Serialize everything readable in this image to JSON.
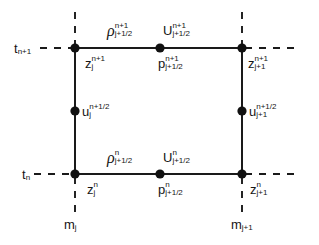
{
  "figure": {
    "type": "staggered-grid-stencil-diagram",
    "background_color": "#ffffff",
    "line_color": "#1a1a1a",
    "node_color": "#111111"
  },
  "axes": {
    "time_labels": [
      {
        "base": "t",
        "sub": "n+1",
        "sup": ""
      },
      {
        "base": "t",
        "sub": "n",
        "sup": ""
      }
    ],
    "mass_labels": [
      {
        "base": "m",
        "sub": "j",
        "sup": ""
      },
      {
        "base": "m",
        "sub": "j+1",
        "sup": ""
      }
    ]
  },
  "labels": {
    "rho_top": {
      "base": "ρ",
      "sup": "n+1",
      "sub": "j+1/2"
    },
    "U_top": {
      "base": "U",
      "sup": "n+1",
      "sub": "j+1/2"
    },
    "z_top_left": {
      "base": "z",
      "sup": "n+1",
      "sub": "j"
    },
    "p_top": {
      "base": "p",
      "sup": "n+1",
      "sub": "j+1/2"
    },
    "z_top_right": {
      "base": "z",
      "sup": "n+1",
      "sub": "j+1"
    },
    "u_left": {
      "base": "u",
      "sup": "n+1/2",
      "sub": "j"
    },
    "u_right": {
      "base": "u",
      "sup": "n+1/2",
      "sub": "j+1"
    },
    "rho_bot": {
      "base": "ρ",
      "sup": "n",
      "sub": "j+1/2"
    },
    "U_bot": {
      "base": "U",
      "sup": "n",
      "sub": "j+1/2"
    },
    "z_bot_left": {
      "base": "z",
      "sup": "n",
      "sub": "j"
    },
    "p_bot": {
      "base": "p",
      "sup": "n",
      "sub": "j+1/2"
    },
    "z_bot_right": {
      "base": "z",
      "sup": "n",
      "sub": "j+1"
    }
  },
  "geometry": {
    "left_x": 75,
    "right_x": 242,
    "top_y": 48,
    "bottom_y": 174,
    "mid_x": 160,
    "mid_y": 111,
    "node_radius": 4.6
  }
}
